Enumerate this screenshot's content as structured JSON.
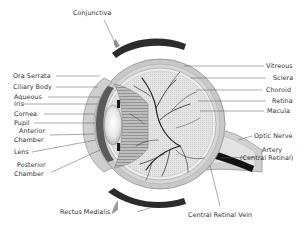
{
  "diagram": {
    "colors": {
      "background": "#ffffff",
      "sclera": "#c9c9c9",
      "vitreous": "#e2e2e2",
      "muscle": "#2e2e2e",
      "vessels": "#1a1a1a",
      "leader_lines": "#555555",
      "text": "#333333"
    },
    "labels": {
      "top": {
        "conjunctiva": "Conjunctiva"
      },
      "left": {
        "ora_serrata": "Ora Serrata",
        "ciliary_body": "Ciliary Body",
        "aqueous": "Aqueous",
        "iris": "Iris",
        "cornea": "Cornea",
        "pupil": "Pupil",
        "anterior_chamber_1": "Anterior",
        "anterior_chamber_2": "Chamber",
        "lens": "Lens",
        "posterior_chamber_1": "Posterior",
        "posterior_chamber_2": "Chamber"
      },
      "right": {
        "vitreous": "Vitreous",
        "sclera": "Sclera",
        "choroid": "Choroid",
        "retina": "Retina",
        "macula": "Macula",
        "optic_nerve": "Optic Nerve",
        "artery_1": "Artery",
        "artery_2": "(Central Retinal)"
      },
      "bottom": {
        "rectus_medialis": "Rectus Medialis",
        "central_retinal_vein": "Central Retinal Vein"
      }
    }
  }
}
